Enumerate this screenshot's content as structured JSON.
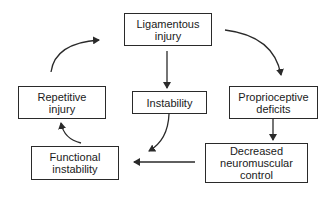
{
  "diagram": {
    "type": "cycle-flowchart",
    "nodes": [
      {
        "id": "ligamentous",
        "label": "Ligamentous\ninjury",
        "x": 124,
        "y": 13,
        "w": 88,
        "h": 33
      },
      {
        "id": "repetitive",
        "label": "Repetitive\ninjury",
        "x": 18,
        "y": 86,
        "w": 88,
        "h": 33
      },
      {
        "id": "instability",
        "label": "Instability",
        "x": 132,
        "y": 91,
        "w": 75,
        "h": 23
      },
      {
        "id": "proprioceptive",
        "label": "Proprioceptive\ndeficits",
        "x": 229,
        "y": 86,
        "w": 89,
        "h": 33
      },
      {
        "id": "functional",
        "label": "Functional\ninstability",
        "x": 31,
        "y": 146,
        "w": 88,
        "h": 34
      },
      {
        "id": "decreased",
        "label": "Decreased\nneuromuscular\ncontrol",
        "x": 205,
        "y": 143,
        "w": 103,
        "h": 40
      }
    ],
    "edges": [
      {
        "from": "ligamentous",
        "to": "instability"
      },
      {
        "from": "ligamentous",
        "to": "proprioceptive"
      },
      {
        "from": "proprioceptive",
        "to": "decreased"
      },
      {
        "from": "decreased",
        "to": "functional"
      },
      {
        "from": "instability",
        "to": "functional"
      },
      {
        "from": "functional",
        "to": "repetitive"
      },
      {
        "from": "repetitive",
        "to": "ligamentous"
      }
    ],
    "colors": {
      "stroke": "#2a2a2a",
      "text": "#1a1a1a",
      "background": "#ffffff"
    }
  }
}
